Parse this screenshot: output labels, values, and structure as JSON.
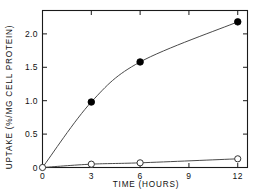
{
  "chart_data": {
    "type": "line",
    "title": "",
    "subtitle": "",
    "xlabel": "TIME (HOURS)",
    "ylabel": "UPTAKE (%/MG CELL PROTEIN)",
    "xlim": [
      0,
      12.6
    ],
    "ylim": [
      0,
      2.35
    ],
    "xticks": [
      0,
      3,
      6,
      9,
      12
    ],
    "xticklabels": [
      "0",
      "3",
      "6",
      "9",
      "12"
    ],
    "yticks": [
      0,
      0.5,
      1.0,
      1.5,
      2.0
    ],
    "yticklabels": [
      "0",
      "0.5",
      "1.0",
      "1.5",
      "2.0"
    ],
    "grid": false,
    "legend": "none",
    "frame": "box",
    "tick_direction": "in",
    "series": [
      {
        "name": "filled-circles",
        "marker": "filled-circle",
        "x": [
          0,
          3,
          6,
          12
        ],
        "values": [
          0,
          0.98,
          1.58,
          2.18
        ]
      },
      {
        "name": "open-circles",
        "marker": "open-circle",
        "x": [
          0,
          3,
          6,
          12
        ],
        "values": [
          0,
          0.05,
          0.07,
          0.13
        ]
      }
    ]
  },
  "axes": {
    "x_title": "TIME (HOURS)",
    "y_title": "UPTAKE (%/MG CELL PROTEIN)"
  },
  "colors": {
    "axis": "#1a1a1a",
    "curve": "#4a4a4a",
    "filled_marker": "#000000",
    "open_marker_fill": "#ffffff",
    "open_marker_stroke": "#333333",
    "background": "#ffffff"
  }
}
